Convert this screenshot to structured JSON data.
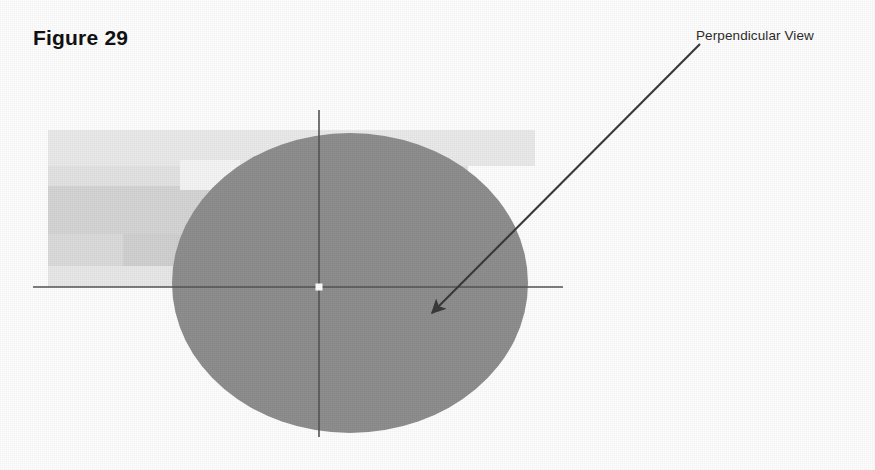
{
  "figure": {
    "caption": "Figure 29",
    "callout_label": "Perpendicular View",
    "background_color": "#ffffff",
    "disc": {
      "name": "shaded-disc",
      "fill_color": "#8f8f8f",
      "center_x": 350,
      "center_y": 283,
      "radius_x": 178,
      "radius_y": 150
    },
    "axes": {
      "line_color": "#555555",
      "center_marker_color": "#ffffff",
      "horizontal": {
        "x1": 33,
        "y1": 287,
        "x2": 563,
        "y2": 287
      },
      "vertical": {
        "x1": 319,
        "y1": 110,
        "x2": 319,
        "y2": 437
      }
    },
    "callout_arrow": {
      "color": "#3a3a3a",
      "start_x": 700,
      "start_y": 44,
      "end_x": 432,
      "end_y": 313
    },
    "background_blocks": [
      {
        "name": "block-upper-light",
        "x": 48,
        "y": 130,
        "width": 487,
        "height": 36,
        "fill": "#ebebeb"
      },
      {
        "name": "block-upper-wide",
        "x": 48,
        "y": 166,
        "width": 420,
        "height": 20,
        "fill": "#e4e4e4"
      },
      {
        "name": "block-mid-band",
        "x": 48,
        "y": 186,
        "width": 420,
        "height": 48,
        "fill": "#d6d6d6"
      },
      {
        "name": "block-left-tall",
        "x": 48,
        "y": 234,
        "width": 75,
        "height": 45,
        "fill": "#dcdcdc"
      },
      {
        "name": "block-mid-lower",
        "x": 123,
        "y": 234,
        "width": 120,
        "height": 45,
        "fill": "#d2d2d2"
      },
      {
        "name": "block-right-lower",
        "x": 243,
        "y": 234,
        "width": 180,
        "height": 45,
        "fill": "#dedede"
      },
      {
        "name": "block-bottom-strip",
        "x": 48,
        "y": 266,
        "width": 375,
        "height": 21,
        "fill": "#e9e9e9"
      },
      {
        "name": "block-notch-white",
        "x": 180,
        "y": 160,
        "width": 60,
        "height": 30,
        "fill": "#f6f6f6"
      }
    ]
  }
}
